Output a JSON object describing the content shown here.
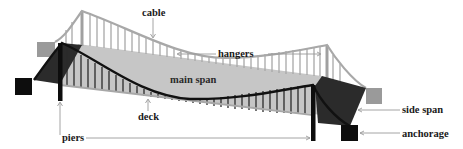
{
  "diagram": {
    "labels": {
      "cable": "cable",
      "hangers": "hangers",
      "main_span": "main span",
      "deck": "deck",
      "piers": "piers",
      "side_span": "side span",
      "anchorage": "anchorage"
    },
    "colors": {
      "background": "#ffffff",
      "cable_back": "#a8a8a8",
      "deck_surface": "#c4c4c4",
      "front_cable": "#111111",
      "side_span_dark": "#2b2b2b",
      "anchorage": "#0d0d0d",
      "back_block": "#9a9a9a",
      "leader_line": "#9a9a9a",
      "text": "#1a1a1a"
    }
  }
}
